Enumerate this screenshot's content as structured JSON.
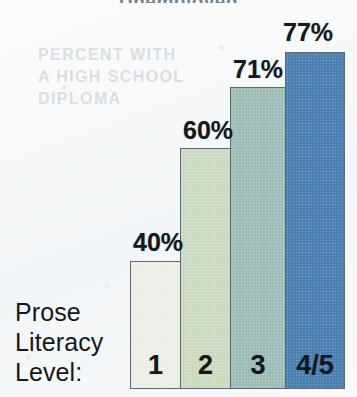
{
  "page": {
    "background_color": "#f6f8f9",
    "title_remnant": "Unemployed",
    "bleed_through_line1": "PERCENT WITH",
    "bleed_through_line2": "A HIGH SCHOOL",
    "bleed_through_line3": "DIPLOMA"
  },
  "axis": {
    "title_line1": "Prose",
    "title_line2": "Literacy",
    "title_line3": "Level:"
  },
  "chart_data": {
    "type": "bar",
    "title": "",
    "xlabel": "Prose Literacy Level:",
    "ylabel": "",
    "ylim": [
      0,
      100
    ],
    "grid": false,
    "legend": null,
    "categories": [
      "1",
      "2",
      "3",
      "4/5"
    ],
    "values": [
      40,
      60,
      71,
      77
    ],
    "value_labels": [
      "40%",
      "60%",
      "71%",
      "77%"
    ],
    "colors": [
      "#eef0e8",
      "#cedcc4",
      "#9fbfb8",
      "#4a80b4"
    ],
    "bar_outline_color": "#5d6b6b"
  },
  "geometry": {
    "baseline_y": 389,
    "plot_left": 130,
    "plot_right": 345,
    "bar_tops": [
      261,
      148,
      87,
      52
    ],
    "bar_lefts": [
      130,
      180,
      230,
      285
    ],
    "bar_widths": [
      51,
      51,
      56,
      60
    ],
    "label_positions": [
      {
        "x": 133,
        "y": 228
      },
      {
        "x": 183,
        "y": 116
      },
      {
        "x": 233,
        "y": 55
      },
      {
        "x": 283,
        "y": 18
      }
    ],
    "cat_label_y": 350
  }
}
